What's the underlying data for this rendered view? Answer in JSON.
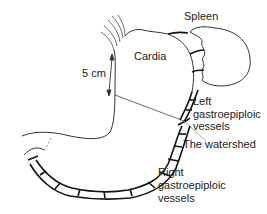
{
  "labels": {
    "spleen": "Spleen",
    "cardia": "Cardia",
    "distance": "5 cm",
    "left_vessels_1": "Left",
    "left_vessels_2": "gastroepiploic",
    "left_vessels_3": "vessels",
    "watershed": "The watershed",
    "right_vessels_1": "Right",
    "right_vessels_2": "gastroepiploic",
    "right_vessels_3": "vessels"
  },
  "colors": {
    "outline": "#333333",
    "vessel": "#111111",
    "leader": "#777777",
    "text": "#222222"
  }
}
